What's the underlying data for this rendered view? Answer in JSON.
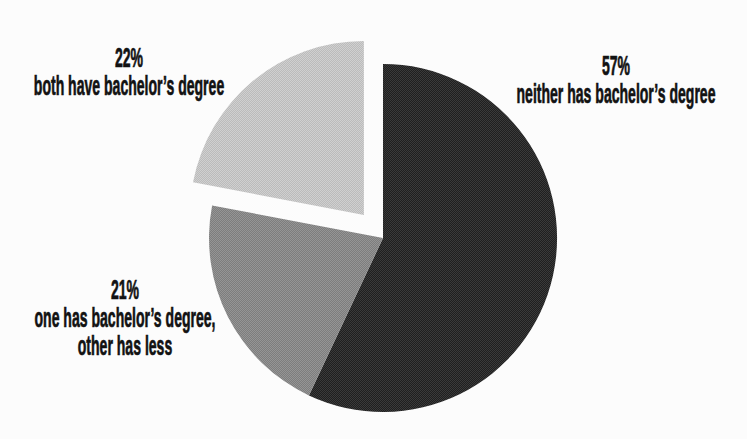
{
  "canvas": {
    "width": 747,
    "height": 439,
    "background": "#fcfcfc",
    "text_color": "#121212"
  },
  "chart_data": {
    "type": "pie",
    "title": "",
    "categories": [
      "neither has bachelor’s degree",
      "one has bachelor’s degree, other has less",
      "both have bachelor’s degree"
    ],
    "values": [
      57,
      21,
      22
    ],
    "start_angle": "12-oclock",
    "direction": "clockwise",
    "legend": "none",
    "slices": [
      {
        "id": "neither",
        "label": "neither has bachelor’s degree",
        "value": 57,
        "color": "#1f1f1f",
        "texture_color": "#3a3a3a",
        "exploded": false
      },
      {
        "id": "one-has",
        "label": "one has bachelor’s degree, other has less",
        "value": 21,
        "color": "#7d7d7d",
        "texture_color": "#959595",
        "exploded": false
      },
      {
        "id": "both",
        "label": "both have bachelor’s degree",
        "value": 22,
        "color": "#bbbbbb",
        "texture_color": "#d0d0d0",
        "exploded": true
      }
    ],
    "layout": {
      "cx": 383,
      "cy": 238,
      "r": 174,
      "explode_px": 30
    },
    "slice_labels": [
      {
        "lines": [
          "57%",
          "neither has bachelor’s degree"
        ]
      },
      {
        "lines": [
          "21%",
          "one has bachelor’s degree,",
          "other has less"
        ]
      },
      {
        "lines": [
          "22%",
          "both have bachelor’s degree"
        ]
      }
    ]
  }
}
